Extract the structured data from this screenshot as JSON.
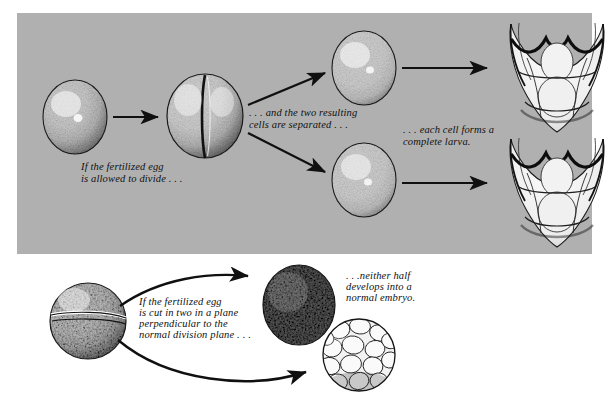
{
  "figure": {
    "background_color": "#ffffff",
    "panel_color": "#b0b0b0",
    "ink_color": "#101010"
  },
  "captions": {
    "top_left": "If the fertilized egg\nis allowed to divide . . .",
    "top_middle": ". . . and  the  two  resulting\ncells are separated . . .",
    "top_right": ". . . each cell forms a\ncomplete larva.",
    "bottom_left": "If the fertilized egg\nis cut in two in a plane\nperpendicular to the\nnormal division plane . . .",
    "bottom_right": ". . .neither half\ndevelops into a\nnormal embryo."
  },
  "specimens": {
    "fertilized_egg": "fertilized-egg",
    "two_cell_stage": "two-cell-embryo",
    "separated_cell_upper": "separated-blastomere-upper",
    "separated_cell_lower": "separated-blastomere-lower",
    "larva_upper": "pluteus-larva-upper",
    "larva_lower": "pluteus-larva-lower",
    "cut_egg": "equatorially-cut-egg",
    "abnormal_blastula": "abnormal-blastula",
    "abnormal_morula": "abnormal-morula"
  },
  "arrows": {
    "egg_to_two_cell": "arrow-straight-right",
    "two_cell_to_upper": "arrow-diagonal-up-right",
    "two_cell_to_lower": "arrow-diagonal-down-right",
    "upper_cell_to_larva": "arrow-straight-right",
    "lower_cell_to_larva": "arrow-straight-right",
    "cut_egg_to_blastula": "arrow-curved-up-right",
    "cut_egg_to_morula": "arrow-curved-down-right"
  }
}
